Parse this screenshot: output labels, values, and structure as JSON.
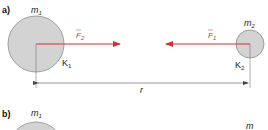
{
  "panels": [
    {
      "id": "a",
      "label": "a)",
      "body1": {
        "name": "m",
        "sub": "1",
        "frame": "K",
        "frame_sub": "1"
      },
      "body2": {
        "name": "m",
        "sub": "2",
        "frame": "K",
        "frame_sub": "2"
      },
      "forces": [
        {
          "name": "F",
          "sub": "2",
          "acts_on": "m1",
          "direction": "right"
        },
        {
          "name": "F",
          "sub": "1",
          "acts_on": "m2",
          "direction": "left"
        }
      ],
      "distance_label": "r"
    },
    {
      "id": "b",
      "label": "b)",
      "body1": {
        "name": "m",
        "sub": "1"
      },
      "body2": {
        "name": "m",
        "sub": "2"
      }
    }
  ],
  "colors": {
    "body_fill": "#d3d3d3",
    "body_stroke": "#8a8a8a",
    "force": "#d0312d",
    "line": "#555555"
  }
}
